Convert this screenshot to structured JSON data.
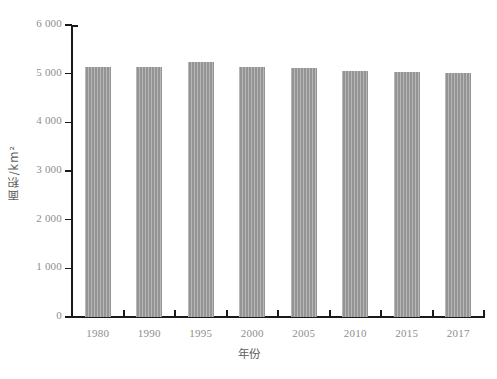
{
  "chart_data": {
    "type": "bar",
    "title": "",
    "xlabel": "年份",
    "ylabel": "面积/km²",
    "categories": [
      "1980",
      "1990",
      "1995",
      "2000",
      "2005",
      "2010",
      "2015",
      "2017"
    ],
    "values": [
      5140,
      5140,
      5230,
      5140,
      5120,
      5060,
      5030,
      5010
    ],
    "ylim": [
      0,
      6000
    ],
    "y_ticks": [
      0,
      1000,
      2000,
      3000,
      4000,
      5000,
      6000
    ],
    "y_tick_labels": [
      "0",
      "1 000",
      "2 000",
      "3 000",
      "4 000",
      "5 000",
      "6 000"
    ],
    "grid": false,
    "legend": false,
    "bar_color": "#9c9c9c",
    "axis_color": "#1a1a1a",
    "tick_label_color": "#8e8e8e",
    "background_color": "#ffffff"
  }
}
